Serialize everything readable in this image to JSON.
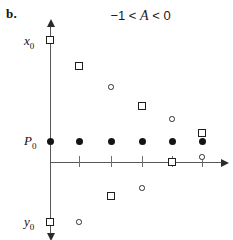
{
  "panel": {
    "label": "b."
  },
  "title": {
    "prefix": "−1 < ",
    "variable": "A",
    "suffix": " < 0"
  },
  "axes": {
    "y_axis_name": "vertical-axis",
    "x_axis_name": "horizontal-axis",
    "origin_x_px": 50,
    "origin_y_px": 162,
    "y_top_px": 26,
    "y_bottom_px": 234,
    "x_right_px": 222
  },
  "labels": [
    {
      "id": "x0",
      "text": "x",
      "sub": "0",
      "x": 24,
      "y": 33
    },
    {
      "id": "P0",
      "text": "P",
      "sub": "0",
      "x": 24,
      "y": 133
    },
    {
      "id": "y0",
      "text": "y",
      "sub": "0",
      "x": 24,
      "y": 214
    }
  ],
  "ticks": [
    {
      "x": 79
    },
    {
      "x": 111
    },
    {
      "x": 142
    },
    {
      "x": 172
    },
    {
      "x": 202
    }
  ],
  "chart_data": {
    "type": "scatter",
    "title": "−1 < A < 0",
    "xlabel": "",
    "ylabel": "",
    "grid": false,
    "legend": null,
    "annotations": [
      "b.",
      "x₀",
      "P₀",
      "y₀"
    ],
    "axis_value_labels": {
      "x0": {
        "pixel_y": 40,
        "meaning": "upper bound of oscillation"
      },
      "P0": {
        "pixel_y": 141,
        "meaning": "fixed point / equilibrium level"
      },
      "y0": {
        "pixel_y": 222,
        "meaning": "lower bound of oscillation"
      }
    },
    "x_tick_pixels": [
      50,
      79,
      111,
      142,
      172,
      202
    ],
    "series": [
      {
        "name": "equilibrium-dots",
        "marker": "filled-circle",
        "points": [
          {
            "x": 50,
            "y": 141
          },
          {
            "x": 79,
            "y": 141
          },
          {
            "x": 111,
            "y": 141
          },
          {
            "x": 142,
            "y": 141
          },
          {
            "x": 172,
            "y": 141
          },
          {
            "x": 202,
            "y": 141
          }
        ]
      },
      {
        "name": "square-orbit",
        "marker": "open-square",
        "points": [
          {
            "x": 50,
            "y": 40
          },
          {
            "x": 79,
            "y": 66
          },
          {
            "x": 111,
            "y": 196
          },
          {
            "x": 142,
            "y": 106
          },
          {
            "x": 172,
            "y": 162
          },
          {
            "x": 202,
            "y": 133
          },
          {
            "x": 50,
            "y": 222
          }
        ]
      },
      {
        "name": "circle-orbit",
        "marker": "open-circle",
        "points": [
          {
            "x": 79,
            "y": 222
          },
          {
            "x": 111,
            "y": 87
          },
          {
            "x": 142,
            "y": 188
          },
          {
            "x": 172,
            "y": 119
          },
          {
            "x": 202,
            "y": 157
          }
        ]
      }
    ]
  },
  "colors": {
    "axis": "#58585a",
    "arrow": "#2b2b2b",
    "tick": "#6e6e70",
    "marker_fill": "#141414",
    "marker_outline": "#1e1e1e",
    "text": "#111111",
    "background": "#ffffff"
  }
}
